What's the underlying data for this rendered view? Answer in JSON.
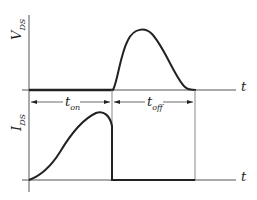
{
  "diagram": {
    "title": "",
    "upper_plot": {
      "y_label_main": "V",
      "y_label_sub": "DS",
      "x_label": "t"
    },
    "lower_plot": {
      "y_label_main": "I",
      "y_label_sub": "DS",
      "x_label": "t"
    },
    "intervals": [
      {
        "main": "t",
        "sub": "on"
      },
      {
        "main": "t",
        "sub": "off"
      }
    ],
    "colors": {
      "curve": "#222222",
      "axis": "#555555",
      "guide": "#888888"
    }
  }
}
